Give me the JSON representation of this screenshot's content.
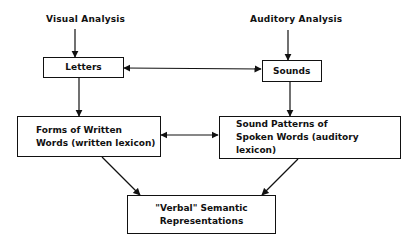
{
  "inputs": {
    "visual": "Visual Analysis",
    "auditory": "Auditory Analysis"
  },
  "boxes": {
    "letters": "Letters",
    "sounds": "Sounds",
    "written_forms": [
      "Forms of Written",
      "Words (written lexicon)"
    ],
    "spoken_patterns": [
      "Sound Patterns of",
      "Spoken Words (auditory lexicon)"
    ],
    "semantic": [
      "\"Verbal\" Semantic",
      "Representations"
    ]
  },
  "edges": [
    {
      "from": "Visual Analysis",
      "to": "Letters"
    },
    {
      "from": "Auditory Analysis",
      "to": "Sounds"
    },
    {
      "from": "Letters",
      "to": "Sounds",
      "bidirectional": true
    },
    {
      "from": "Letters",
      "to": "Forms of Written Words"
    },
    {
      "from": "Sounds",
      "to": "Sound Patterns of Spoken Words"
    },
    {
      "from": "Forms of Written Words",
      "to": "Sound Patterns of Spoken Words",
      "bidirectional": true
    },
    {
      "from": "Forms of Written Words",
      "to": "Verbal Semantic Representations"
    },
    {
      "from": "Sound Patterns of Spoken Words",
      "to": "Verbal Semantic Representations"
    }
  ]
}
